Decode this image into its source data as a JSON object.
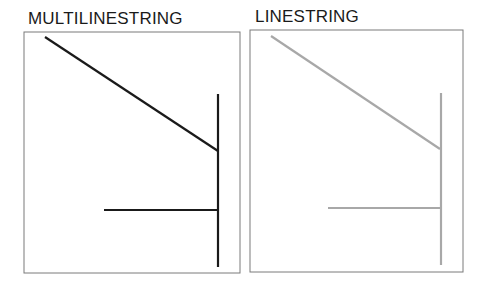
{
  "panels": [
    {
      "title": "MULTILINESTRING",
      "line_color": "#1a1a1a",
      "frame": {
        "x": 24,
        "y": 32,
        "w": 216,
        "h": 241
      },
      "segments": [
        [
          [
            45,
            37
          ],
          [
            218,
            151
          ]
        ],
        [
          [
            218,
            94
          ],
          [
            218,
            267
          ]
        ],
        [
          [
            104,
            210
          ],
          [
            218,
            210
          ]
        ]
      ]
    },
    {
      "title": "LINESTRING",
      "line_color": "#a8a8a8",
      "frame": {
        "x": 250,
        "y": 30,
        "w": 213,
        "h": 242
      },
      "segments": [
        [
          [
            271,
            36
          ],
          [
            440,
            149
          ]
        ],
        [
          [
            441,
            93
          ],
          [
            441,
            265
          ]
        ],
        [
          [
            328,
            208
          ],
          [
            441,
            208
          ]
        ]
      ]
    }
  ],
  "frame_color": "#7a7a7a"
}
